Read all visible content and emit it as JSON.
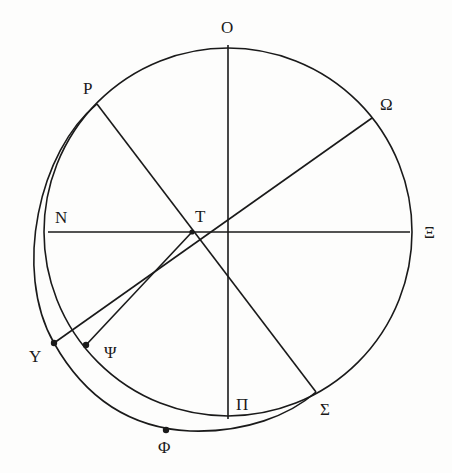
{
  "diagram": {
    "type": "geometric-construction",
    "circle": {
      "center": [
        228,
        232
      ],
      "radius": 183
    },
    "labels": {
      "O": "Ο",
      "P": "Ρ",
      "Omega": "Ω",
      "N": "Ν",
      "T": "Τ",
      "Xi": "Ξ",
      "Upsilon": "Υ",
      "Psi": "Ψ",
      "Pi": "Π",
      "Sigma": "Σ",
      "Phi": "Φ"
    },
    "points": {
      "O": [
        228,
        45
      ],
      "P": [
        97,
        104
      ],
      "Omega": [
        372,
        118
      ],
      "N": [
        48,
        232
      ],
      "T": [
        192,
        232
      ],
      "Xi": [
        410,
        232
      ],
      "Upsilon": [
        54,
        343
      ],
      "Psi": [
        86,
        345
      ],
      "Pi": [
        228,
        419
      ],
      "Sigma": [
        316,
        392
      ],
      "Phi": [
        166,
        430
      ]
    },
    "segments": [
      [
        "O",
        "Pi"
      ],
      [
        "N",
        "Xi"
      ],
      [
        "P",
        "Sigma"
      ],
      [
        "Omega",
        "Upsilon"
      ],
      [
        "T",
        "Psi"
      ]
    ],
    "arcs": [
      {
        "name": "main-circle"
      },
      {
        "name": "outer-crescent",
        "through": [
          "P",
          "Upsilon",
          "Phi",
          "Sigma"
        ]
      }
    ]
  }
}
